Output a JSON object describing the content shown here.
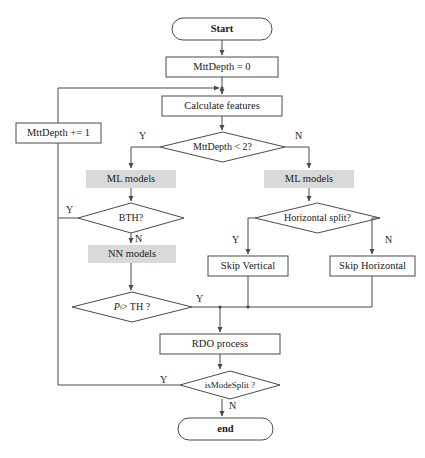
{
  "diagram": {
    "type": "flowchart",
    "colors": {
      "stroke": "#4a4a4a",
      "text": "#1a1a1a",
      "shaded_fill": "#d9d9d9",
      "background": "#ffffff"
    },
    "nodes": [
      {
        "id": "start",
        "shape": "terminal",
        "label": "Start",
        "x": 172,
        "y": 18,
        "w": 100,
        "h": 22
      },
      {
        "id": "mttdepth0",
        "shape": "process",
        "label": "MttDepth = 0",
        "x": 166,
        "y": 57,
        "w": 112,
        "h": 20
      },
      {
        "id": "calcfeat",
        "shape": "process",
        "label": "Calculate features",
        "x": 162,
        "y": 96,
        "w": 120,
        "h": 20
      },
      {
        "id": "mttdepthinc",
        "shape": "process",
        "label": "MttDepth += 1",
        "x": 16,
        "y": 123,
        "w": 85,
        "h": 20
      },
      {
        "id": "mttdepthlt2",
        "shape": "decision",
        "label": "MttDepth < 2?",
        "x": 160,
        "y": 132,
        "w": 125,
        "h": 30
      },
      {
        "id": "mlmodelsL",
        "shape": "shaded",
        "label": "ML models",
        "x": 86,
        "y": 170,
        "w": 90,
        "h": 18
      },
      {
        "id": "mlmodelsR",
        "shape": "shaded",
        "label": "ML models",
        "x": 264,
        "y": 170,
        "w": 90,
        "h": 18
      },
      {
        "id": "bth",
        "shape": "decision",
        "label": "BTH?",
        "x": 78,
        "y": 203,
        "w": 106,
        "h": 30
      },
      {
        "id": "hsplit",
        "shape": "decision",
        "label": "Horizontal split?",
        "x": 255,
        "y": 203,
        "w": 125,
        "h": 30
      },
      {
        "id": "nnmodels",
        "shape": "shaded",
        "label": "NN models",
        "x": 88,
        "y": 245,
        "w": 88,
        "h": 18
      },
      {
        "id": "skipvert",
        "shape": "process",
        "label": "Skip Vertical",
        "x": 208,
        "y": 256,
        "w": 80,
        "h": 20
      },
      {
        "id": "skiphoriz",
        "shape": "process",
        "label": "Skip Horizontal",
        "x": 330,
        "y": 256,
        "w": 85,
        "h": 20
      },
      {
        "id": "pith",
        "shape": "decision",
        "label": "Pi > TH ?",
        "x": 72,
        "y": 292,
        "w": 120,
        "h": 30
      },
      {
        "id": "rdo",
        "shape": "process",
        "label": "RDO process",
        "x": 160,
        "y": 334,
        "w": 120,
        "h": 20
      },
      {
        "id": "ismodesplit",
        "shape": "decision",
        "label": "isModeSplit ?",
        "x": 180,
        "y": 371,
        "w": 100,
        "h": 28
      },
      {
        "id": "end",
        "shape": "terminal",
        "label": "end",
        "x": 178,
        "y": 418,
        "w": 95,
        "h": 22
      }
    ],
    "edge_labels": [
      {
        "id": "mttdepth-yes",
        "text": "Y",
        "x": 139,
        "y": 131
      },
      {
        "id": "mttdepth-no",
        "text": "N",
        "x": 295,
        "y": 131
      },
      {
        "id": "bth-yes",
        "text": "Y",
        "x": 66,
        "y": 205
      },
      {
        "id": "bth-no",
        "text": "N",
        "x": 135,
        "y": 234
      },
      {
        "id": "hsplit-yes",
        "text": "Y",
        "x": 232,
        "y": 235
      },
      {
        "id": "hsplit-no",
        "text": "N",
        "x": 385,
        "y": 235
      },
      {
        "id": "pith-yes",
        "text": "Y",
        "x": 196,
        "y": 294
      },
      {
        "id": "ismodesplit-yes",
        "text": "Y",
        "x": 160,
        "y": 375
      },
      {
        "id": "ismodesplit-no",
        "text": "N",
        "x": 229,
        "y": 401
      }
    ],
    "formula": {
      "pith_base": "P",
      "pith_subscript": "i",
      "pith_rest": " > TH ?"
    }
  }
}
